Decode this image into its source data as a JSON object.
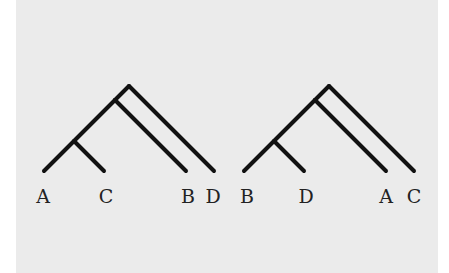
{
  "figure": {
    "background": "#ebebeb",
    "line_color": "#111111",
    "trees": [
      {
        "name": "tree-1",
        "tips": [
          {
            "label": "A",
            "x": 44
          },
          {
            "label": "C",
            "x": 105
          },
          {
            "label": "B",
            "x": 186
          },
          {
            "label": "D",
            "x": 214
          }
        ],
        "topology": "((A,C),B),D"
      },
      {
        "name": "tree-2",
        "tips": [
          {
            "label": "B",
            "x": 244
          },
          {
            "label": "D",
            "x": 305
          },
          {
            "label": "A",
            "x": 386
          },
          {
            "label": "C",
            "x": 414
          }
        ],
        "topology": "((B,D),A),C"
      }
    ]
  }
}
